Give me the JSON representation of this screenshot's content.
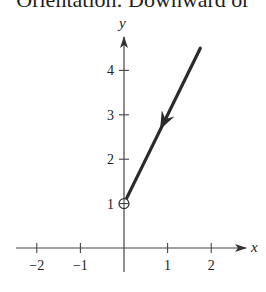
{
  "caption": "Orientation: Downward or",
  "chart_data": {
    "type": "line",
    "title": "",
    "xlabel": "x",
    "ylabel": "y",
    "xlim": [
      -2.5,
      2.7
    ],
    "ylim": [
      0,
      4.7
    ],
    "grid": false,
    "x_ticks": [
      -2,
      -1,
      1,
      2
    ],
    "x_tick_labels": [
      "−2",
      "−1",
      "1",
      "2"
    ],
    "y_ticks": [
      1,
      2,
      3,
      4
    ],
    "y_tick_labels": [
      "1",
      "2",
      "3",
      "4"
    ],
    "series": [
      {
        "name": "curve",
        "x": [
          0,
          1.75
        ],
        "y": [
          1,
          4.5
        ],
        "orientation": "downward",
        "direction_arrow_at": [
          0.92,
          2.85
        ],
        "endpoint_marker": {
          "x": 0,
          "y": 1,
          "style": "open-circle-with-cross"
        }
      }
    ],
    "annotations": []
  }
}
